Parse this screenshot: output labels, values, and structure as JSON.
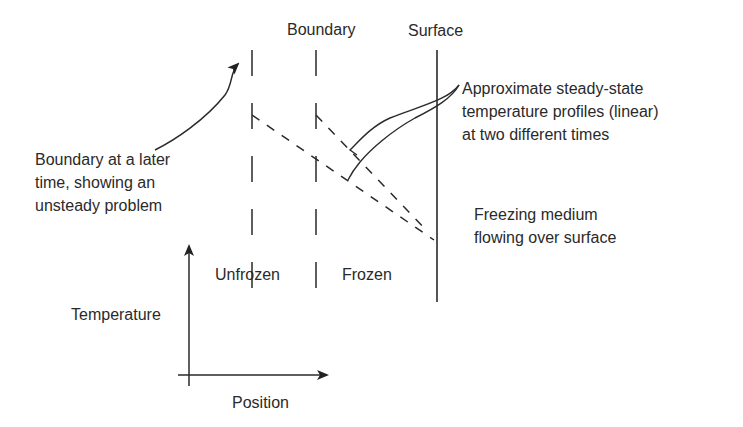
{
  "labels": {
    "boundary": "Boundary",
    "surface": "Surface",
    "approx_line1": "Approximate steady-state",
    "approx_line2": "temperature profiles (linear)",
    "approx_line3": "at two different times",
    "later_line1": "Boundary at a later",
    "later_line2": "time, showing an",
    "later_line3": "unsteady problem",
    "freezing_line1": "Freezing medium",
    "freezing_line2": "flowing over surface",
    "unfrozen": "Unfrozen",
    "frozen": "Frozen",
    "temperature_axis": "Temperature",
    "position_axis": "Position"
  },
  "colors": {
    "ink": "#2a2a2a",
    "background": "#ffffff"
  }
}
